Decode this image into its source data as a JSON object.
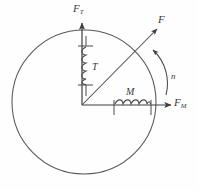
{
  "figure": {
    "background_color": "#fefefe",
    "stroke_color": "#4a4a4a",
    "labels": {
      "vertical_axis": "F",
      "vertical_axis_sub": "T",
      "horizontal_axis": "F",
      "horizontal_axis_sub": "M",
      "resultant_force": "F",
      "vertical_coil": "T",
      "horizontal_coil": "M",
      "rotation": "n"
    },
    "geometry": {
      "circle_center_x": 84,
      "circle_center_y": 102,
      "circle_radius": 72,
      "origin_x": 82,
      "origin_y": 105,
      "vertical_axis_top_y": 22,
      "horizontal_axis_right_x": 172,
      "resultant_arrow_end_x": 156,
      "resultant_arrow_end_y": 28,
      "arc_start_x": 163,
      "arc_start_y": 92,
      "arc_end_x": 152,
      "arc_end_y": 48
    },
    "components": [
      {
        "name": "vertical-coil",
        "label": "T",
        "turns": 5,
        "orientation": "vertical"
      },
      {
        "name": "horizontal-coil",
        "label": "M",
        "turns": 5,
        "orientation": "horizontal"
      }
    ],
    "arrows": [
      {
        "name": "vertical-axis-arrow",
        "label": "F_T",
        "direction": "up"
      },
      {
        "name": "horizontal-axis-arrow",
        "label": "F_M",
        "direction": "right"
      },
      {
        "name": "resultant-force-arrow",
        "label": "F",
        "direction": "up-right"
      },
      {
        "name": "rotation-arc-arrow",
        "label": "n",
        "direction": "counterclockwise"
      }
    ]
  }
}
